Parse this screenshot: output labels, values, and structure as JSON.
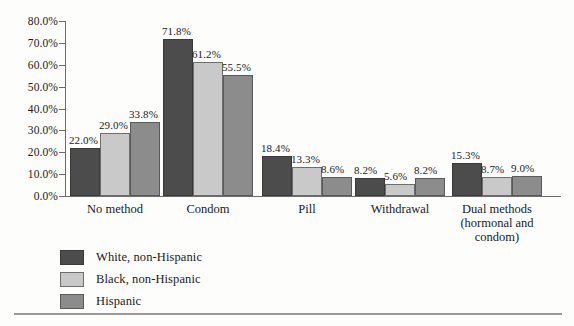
{
  "chart_data": {
    "type": "bar",
    "title": "",
    "subtitle": "",
    "xlabel": "",
    "ylabel": "",
    "ylim": [
      0,
      80
    ],
    "ytick_labels": [
      "0.0%",
      "10.0%",
      "20.0%",
      "30.0%",
      "40.0%",
      "50.0%",
      "60.0%",
      "70.0%",
      "80.0%"
    ],
    "ytick_values": [
      0,
      10,
      20,
      30,
      40,
      50,
      60,
      70,
      80
    ],
    "grid": false,
    "legend_position": "bottom-left",
    "categories": [
      "No method",
      "Condom",
      "Pill",
      "Withdrawal",
      "Dual methods\n(hormonal and\ncondom)"
    ],
    "series": [
      {
        "name": "White, non-Hispanic",
        "color": "#4c4c4c",
        "values": [
          22.0,
          71.8,
          18.4,
          8.2,
          15.3
        ],
        "labels": [
          "22.0%",
          "71.8%",
          "18.4%",
          "8.2%",
          "15.3%"
        ]
      },
      {
        "name": "Black, non-Hispanic",
        "color": "#c9c9c9",
        "values": [
          29.0,
          61.2,
          13.3,
          5.6,
          8.7
        ],
        "labels": [
          "29.0%",
          "61.2%",
          "13.3%",
          "5.6%",
          "8.7%"
        ]
      },
      {
        "name": "Hispanic",
        "color": "#8c8c8c",
        "values": [
          33.8,
          55.5,
          8.6,
          8.2,
          9.0
        ],
        "labels": [
          "33.8%",
          "55.5%",
          "8.6%",
          "8.2%",
          "9.0%"
        ]
      }
    ]
  },
  "legend": {
    "items": [
      {
        "label": "White, non-Hispanic"
      },
      {
        "label": "Black, non-Hispanic"
      },
      {
        "label": "Hispanic"
      }
    ]
  }
}
